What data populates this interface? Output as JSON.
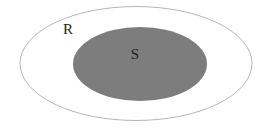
{
  "figure": {
    "type": "venn-diagram",
    "background_color": "#ffffff",
    "width": 272,
    "height": 137
  },
  "sets": {
    "outer": {
      "label": "R",
      "shape": "ellipse",
      "fill_color": "none",
      "stroke_color": "#b5b5b5",
      "stroke_width": 1,
      "cx": 136,
      "cy": 63.5,
      "rx": 116,
      "ry": 57,
      "label_x": 68,
      "label_y": 31
    },
    "inner": {
      "label": "S",
      "shape": "ellipse",
      "fill_color": "#7d7d7d",
      "stroke_color": "none",
      "stroke_width": 0,
      "cx": 140,
      "cy": 64,
      "rx": 67,
      "ry": 37,
      "label_x": 135,
      "label_y": 56
    }
  }
}
